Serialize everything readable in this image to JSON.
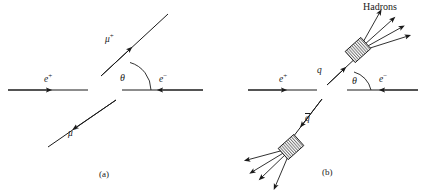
{
  "figure": {
    "caption_a": "(a)",
    "caption_b": "(b)",
    "panels": [
      {
        "id": "panel-a",
        "caption": "(a)",
        "labels": {
          "positron": "e",
          "positron_charge": "+",
          "electron": "e",
          "electron_charge": "−",
          "muon_plus": "μ",
          "muon_plus_charge": "+",
          "muon_minus": "μ",
          "muon_minus_charge": "−",
          "angle": "θ"
        }
      },
      {
        "id": "panel-b",
        "caption": "(b)",
        "labels": {
          "positron": "e",
          "positron_charge": "+",
          "electron": "e",
          "electron_charge": "−",
          "quark": "q",
          "antiquark": "q",
          "antiquark_bar": true,
          "angle": "θ",
          "hadrons": "Hadrons"
        },
        "jets": {
          "upper_arrow_count": 4,
          "lower_arrow_count": 4,
          "blob_shape": "hatched-diamond"
        }
      }
    ],
    "colors": {
      "background": "#ffffff",
      "stroke": "#1a1a1a",
      "text": "#1a1a1a",
      "hatch": "#4a4a4a"
    },
    "geometry": {
      "panel_a_beam_y": 90,
      "panel_b_beam_y": 90,
      "scattering_angle_deg": 47
    }
  }
}
